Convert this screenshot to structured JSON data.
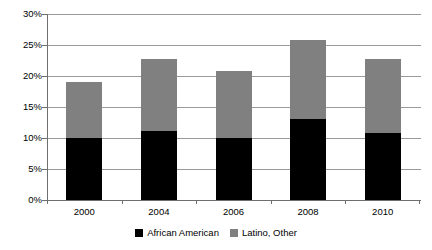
{
  "chart_data": {
    "type": "bar",
    "stacked": true,
    "title": "",
    "subtitle": "",
    "xlabel": "",
    "ylabel": "",
    "categories": [
      "2000",
      "2004",
      "2006",
      "2008",
      "2010"
    ],
    "series": [
      {
        "name": "African American",
        "color": "#000000",
        "values": [
          10.0,
          11.2,
          10.0,
          13.1,
          10.8
        ]
      },
      {
        "name": "Latino, Other",
        "color": "#808080",
        "values": [
          9.0,
          11.6,
          10.8,
          12.7,
          12.0
        ]
      }
    ],
    "totals": [
      19.0,
      22.8,
      20.8,
      25.8,
      22.8
    ],
    "ylim": [
      0,
      30
    ],
    "ytick_values": [
      0,
      5,
      10,
      15,
      20,
      25,
      30
    ],
    "ytick_labels": [
      "0%",
      "5%",
      "10%",
      "15%",
      "20%",
      "25%",
      "30%"
    ],
    "value_suffix": "%",
    "grid": true,
    "grid_axis": "y",
    "legend_position": "bottom",
    "axis_color": "#6f6f6f",
    "grid_color": "#9a9a9a",
    "background": "#ffffff"
  },
  "legend": {
    "entries": [
      {
        "label": "African American",
        "color": "#000000"
      },
      {
        "label": "Latino, Other",
        "color": "#808080"
      }
    ]
  }
}
